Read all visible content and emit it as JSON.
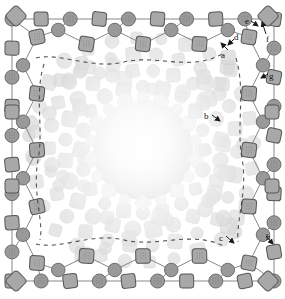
{
  "figure": {
    "width": 285,
    "height": 299,
    "background": "#ffffff"
  },
  "palette": {
    "node_fill_dark": "#999999",
    "node_fill_mid": "#a8a8a8",
    "node_stroke_dark": "#555555",
    "node_stroke_mid": "#6e6e6e",
    "edge_stroke": "#7a7a7a",
    "dashed_stroke": "#3a3a3a",
    "faded_fill": "#d9d9d9",
    "faded_stroke": "#cccccc",
    "core_center": "#f2f2f2",
    "core_edge": "#c9c9c9",
    "label_color": "#111111",
    "arrow_color": "#1a1a1a"
  },
  "labels": [
    {
      "id": "a",
      "text": "a",
      "x": 221,
      "y": 51,
      "arrow": {
        "x1": 228,
        "y1": 50,
        "x2": 221,
        "y2": 43
      }
    },
    {
      "id": "b",
      "text": "b",
      "x": 204,
      "y": 112,
      "arrow": {
        "x1": 212,
        "y1": 115,
        "x2": 220,
        "y2": 121
      }
    },
    {
      "id": "c",
      "text": "c",
      "x": 219,
      "y": 234,
      "arrow": {
        "x1": 226,
        "y1": 236,
        "x2": 234,
        "y2": 243
      }
    },
    {
      "id": "d",
      "text": "d",
      "x": 234,
      "y": 33,
      "arrow": {
        "x1": 234,
        "y1": 39,
        "x2": 228,
        "y2": 45
      }
    },
    {
      "id": "e",
      "text": "e",
      "x": 245,
      "y": 17,
      "arrow": {
        "x1": 251,
        "y1": 21,
        "x2": 258,
        "y2": 26
      }
    },
    {
      "id": "f",
      "text": "f",
      "x": 266,
      "y": 35,
      "arrow": {
        "x1": 266,
        "y1": 34,
        "x2": 262,
        "y2": 22
      }
    },
    {
      "id": "g",
      "text": "g",
      "x": 269,
      "y": 72,
      "arrow": {
        "x1": 268,
        "y1": 74,
        "x2": 261,
        "y2": 78
      }
    },
    {
      "id": "h",
      "text": "h",
      "x": 266,
      "y": 233,
      "arrow": {
        "x1": 266,
        "y1": 236,
        "x2": 273,
        "y2": 244
      }
    }
  ],
  "legend_note": "",
  "structure": {
    "outer_frame_rings": 2,
    "core_radius": 48,
    "shape_kinds": [
      "circle",
      "rounded-square"
    ]
  }
}
